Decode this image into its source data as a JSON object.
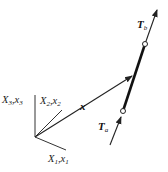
{
  "diagram": {
    "axes": {
      "x1_label": "X",
      "x1_sub": "1",
      "x1_lower": ",x",
      "x1_lower_sub": "1",
      "x2_label": "X",
      "x2_sub": "2",
      "x2_lower": ",x",
      "x2_lower_sub": "2",
      "x3_label": "X",
      "x3_sub": "3",
      "x3_lower": ",x",
      "x3_lower_sub": "3"
    },
    "position_vector_label": "x",
    "traction_start": {
      "label": "T",
      "sub": "a"
    },
    "traction_end": {
      "label": "T",
      "sub": "b"
    },
    "colors": {
      "line": "#222222",
      "background": "#ffffff"
    }
  }
}
